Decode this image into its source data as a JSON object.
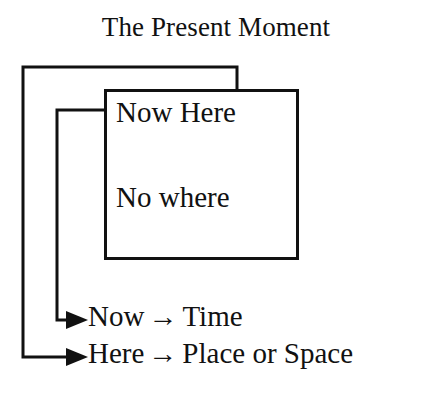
{
  "diagram": {
    "title": "The Present Moment",
    "box": {
      "lines": [
        {
          "id": "now-here",
          "text": "Now Here"
        },
        {
          "id": "no-where",
          "text": "No where"
        }
      ]
    },
    "legend": [
      {
        "id": "now",
        "source": "Now",
        "arrow": "→",
        "target": "Time"
      },
      {
        "id": "here",
        "source": "Here",
        "arrow": "→",
        "target": "Place or Space"
      }
    ],
    "connectors": [
      {
        "id": "inner-connector",
        "from": "box-left-edge",
        "to": "legend-row-now",
        "arrowhead": "right-arrowhead-icon"
      },
      {
        "id": "outer-connector",
        "from": "box-top-edge",
        "to": "legend-row-here",
        "arrowhead": "right-arrowhead-icon"
      }
    ],
    "colors": {
      "ink": "#111111",
      "paper": "#ffffff"
    }
  }
}
